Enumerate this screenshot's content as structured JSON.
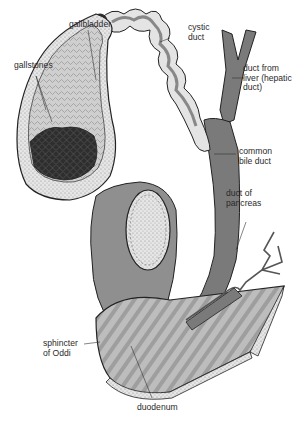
{
  "figure": {
    "labels": {
      "gallbladder": "gallbladder",
      "gallstones": "gallstones",
      "cystic_duct": "cystic\nduct",
      "hepatic_duct": "duct from\nliver (hepatic\nduct)",
      "common_bile_duct": "common\nbile duct",
      "pancreatic_duct": "duct of\npancreas",
      "sphincter": "sphincter\nof Oddi",
      "duodenum": "duodenum"
    },
    "colors": {
      "background": "#ffffff",
      "duct_fill": "#7a7a7a",
      "gallbladder_wall": "#d8d8d8",
      "stipple": "#b5b5b5",
      "stones": "#2e2e2e",
      "outline": "#222222",
      "duodenum_fill": "#a8a8a8"
    }
  }
}
